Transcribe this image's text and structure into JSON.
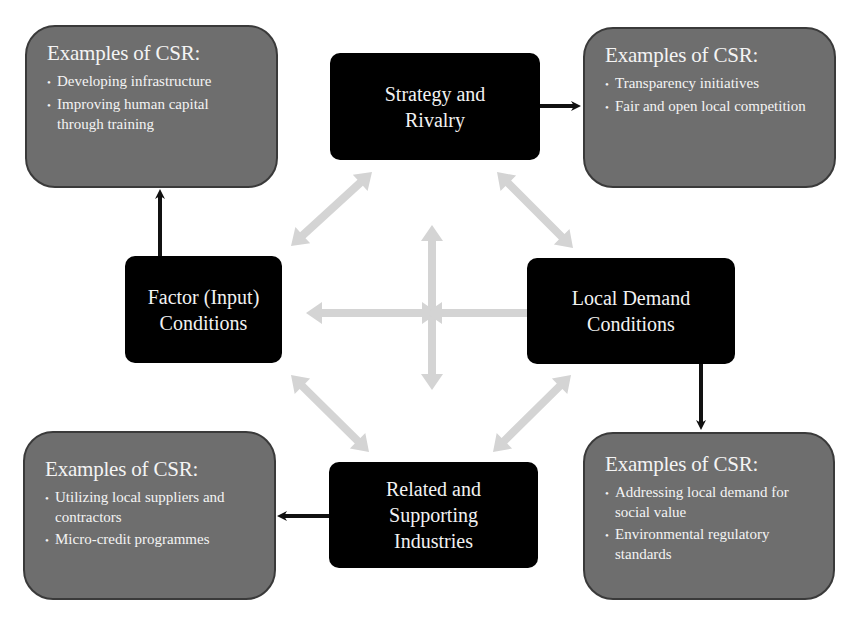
{
  "diagram": {
    "nodes": {
      "strategy": "Strategy and Rivalry",
      "factor": "Factor (Input) Conditions",
      "demand": "Local Demand Conditions",
      "related": "Related and Supporting Industries"
    },
    "node_lines": {
      "strategy": [
        "Strategy and",
        "Rivalry"
      ],
      "factor": [
        "Factor (Input)",
        "Conditions"
      ],
      "demand": [
        "Local Demand",
        "Conditions"
      ],
      "related": [
        "Related and",
        "Supporting",
        "Industries"
      ]
    },
    "csr_boxes": {
      "top_left": {
        "title": "Examples of CSR:",
        "items": [
          "Developing infrastructure",
          "Improving human capital through training"
        ]
      },
      "top_right": {
        "title": "Examples of CSR:",
        "items": [
          "Transparency initiatives",
          "Fair and open local competition"
        ]
      },
      "bottom_left": {
        "title": "Examples of CSR:",
        "items": [
          "Utilizing local suppliers and contractors",
          "Micro-credit programmes"
        ]
      },
      "bottom_right": {
        "title": "Examples of CSR:",
        "items": [
          "Addressing local demand for social value",
          "Environmental regulatory standards"
        ]
      }
    },
    "connections": [
      {
        "from": "factor",
        "to": "csr_top_left",
        "style": "solid-black"
      },
      {
        "from": "strategy",
        "to": "csr_top_right",
        "style": "solid-black"
      },
      {
        "from": "demand",
        "to": "csr_bottom_right",
        "style": "solid-black"
      },
      {
        "from": "related",
        "to": "csr_bottom_left",
        "style": "solid-black"
      },
      {
        "from": "strategy",
        "to": "factor",
        "style": "double-gray"
      },
      {
        "from": "strategy",
        "to": "demand",
        "style": "double-gray"
      },
      {
        "from": "factor",
        "to": "related",
        "style": "double-gray"
      },
      {
        "from": "demand",
        "to": "related",
        "style": "double-gray"
      },
      {
        "from": "center",
        "to": "all",
        "style": "four-way-gray"
      }
    ],
    "colors": {
      "node_bg": "#000000",
      "csr_bg": "#6e6e6e",
      "csr_border": "#3a3a3a",
      "gray_arrow": "#d2d2d2",
      "black_arrow": "#111111"
    }
  }
}
